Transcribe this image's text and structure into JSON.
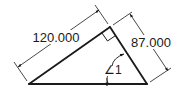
{
  "diagram": {
    "type": "right-triangle-dimension-drawing",
    "colors": {
      "line": "#1a1a1a",
      "background": "#ffffff"
    },
    "vertices": {
      "bottom_left": [
        29,
        84
      ],
      "bottom_right": [
        147,
        84
      ],
      "apex_right_angle": [
        110,
        27
      ]
    },
    "dimensions": {
      "hypotenuse_left_side": {
        "label": "120.000"
      },
      "right_side": {
        "label": "87.000"
      }
    },
    "angle": {
      "label": "∠1"
    },
    "markers": {
      "right_angle": true
    }
  }
}
